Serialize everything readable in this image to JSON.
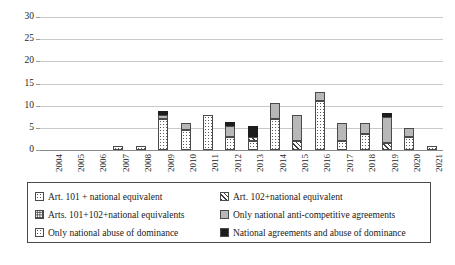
{
  "chart_data": {
    "type": "bar",
    "stacked": true,
    "title": "",
    "xlabel": "",
    "ylabel": "",
    "ylim": [
      0,
      30
    ],
    "yticks": [
      0,
      5,
      10,
      15,
      20,
      25,
      30
    ],
    "grid": true,
    "legend_position": "below",
    "categories": [
      "2004",
      "2005",
      "2006",
      "2007",
      "2008",
      "2009",
      "2010",
      "2011",
      "2012",
      "2013",
      "2014",
      "2015",
      "2016",
      "2017",
      "2018",
      "2019",
      "2020",
      "2021"
    ],
    "series": [
      {
        "name": "Art. 101 + national equivalent",
        "pattern": "dots",
        "values": [
          0,
          0,
          0,
          0.8,
          0.8,
          7,
          4.5,
          8,
          3,
          2,
          7,
          0,
          11,
          2,
          3.5,
          0,
          3,
          1
        ]
      },
      {
        "name": "Art. 102+national equivalent",
        "pattern": "hatch",
        "values": [
          0,
          0,
          0,
          0,
          0,
          0,
          0,
          0,
          0,
          1,
          0,
          2,
          0,
          0,
          0,
          1.5,
          0,
          0
        ]
      },
      {
        "name": "Arts. 101+102+national equivalents",
        "pattern": "dots-dense",
        "values": [
          0,
          0,
          0,
          0,
          0,
          0,
          0,
          0,
          0,
          0,
          0,
          0,
          0,
          0,
          0,
          0,
          0,
          0
        ]
      },
      {
        "name": "Only national anti-competitive agreements",
        "pattern": "gray",
        "values": [
          0,
          0,
          0,
          0,
          0,
          1,
          1.5,
          0,
          2.5,
          0,
          3.5,
          6,
          2,
          4,
          2.5,
          6,
          2,
          0
        ]
      },
      {
        "name": "Only national abuse of dominance",
        "pattern": "dots-corner",
        "values": [
          0,
          0,
          0,
          0,
          0,
          0,
          0,
          0,
          0,
          0,
          0,
          0,
          0,
          0,
          0,
          0,
          0,
          0
        ]
      },
      {
        "name": "National agreements  and abuse of dominance",
        "pattern": "black",
        "values": [
          0,
          0,
          0,
          0,
          0,
          0.8,
          0,
          0,
          0.8,
          2.5,
          0,
          0,
          0,
          0,
          0,
          0.8,
          0,
          0
        ]
      }
    ],
    "totals": [
      0,
      0,
      0,
      0.8,
      0.8,
      8.8,
      6,
      8,
      6.3,
      5.5,
      10.5,
      8,
      13,
      6,
      6,
      8.3,
      5,
      1
    ]
  },
  "legend": {
    "items": [
      {
        "label": "Art. 101 + national equivalent",
        "pattern": "dots"
      },
      {
        "label": "Art. 102+national equivalent",
        "pattern": "hatch"
      },
      {
        "label": "Arts. 101+102+national equivalents",
        "pattern": "dots-dense"
      },
      {
        "label": "Only national anti-competitive agreements",
        "pattern": "gray"
      },
      {
        "label": "Only national abuse of dominance",
        "pattern": "dots-corner"
      },
      {
        "label": "National agreements  and abuse of dominance",
        "pattern": "black"
      }
    ]
  },
  "colors": {
    "gray_fill": "#b8b8b8",
    "black_fill": "#1d1d1d",
    "outline": "#4a4a4a",
    "gridline": "#c9c9c9",
    "axis": "#8a8a8a",
    "text": "#1a1a1a"
  }
}
